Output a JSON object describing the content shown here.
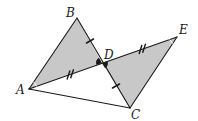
{
  "diagram": {
    "type": "geometry",
    "colors": {
      "stroke": "#1a1a1a",
      "shade": "#c8c8c8",
      "background": "#ffffff"
    },
    "points": {
      "A": {
        "label": "A",
        "x": 29,
        "y": 89
      },
      "B": {
        "label": "B",
        "x": 77,
        "y": 18
      },
      "C": {
        "label": "C",
        "x": 130,
        "y": 108
      },
      "D": {
        "label": "D",
        "x": 102,
        "y": 63
      },
      "E": {
        "label": "E",
        "x": 177,
        "y": 37
      }
    },
    "segments": [
      {
        "from": "A",
        "to": "B"
      },
      {
        "from": "B",
        "to": "C"
      },
      {
        "from": "A",
        "to": "E"
      },
      {
        "from": "E",
        "to": "C"
      },
      {
        "from": "A",
        "to": "C"
      }
    ],
    "shaded_regions": [
      {
        "name": "triangle ABD",
        "vertices": [
          "A",
          "B",
          "D"
        ]
      },
      {
        "name": "triangle DEC",
        "vertices": [
          "D",
          "E",
          "C"
        ]
      }
    ],
    "congruence_marks": [
      {
        "segment": "BD",
        "ticks": 1
      },
      {
        "segment": "DC",
        "ticks": 1
      },
      {
        "segment": "AD",
        "ticks": 2
      },
      {
        "segment": "DE",
        "ticks": 2
      }
    ],
    "angle_marks": [
      {
        "vertex": "D",
        "angle": "ADB",
        "style": "filled"
      },
      {
        "vertex": "D",
        "angle": "EDC",
        "style": "filled"
      },
      {
        "vertex": "A",
        "angle": "BAD",
        "style": "arc"
      },
      {
        "vertex": "E",
        "angle": "DEC",
        "style": "arc"
      }
    ],
    "labels": {
      "A": "A",
      "B": "B",
      "C": "C",
      "D": "D",
      "E": "E"
    }
  }
}
